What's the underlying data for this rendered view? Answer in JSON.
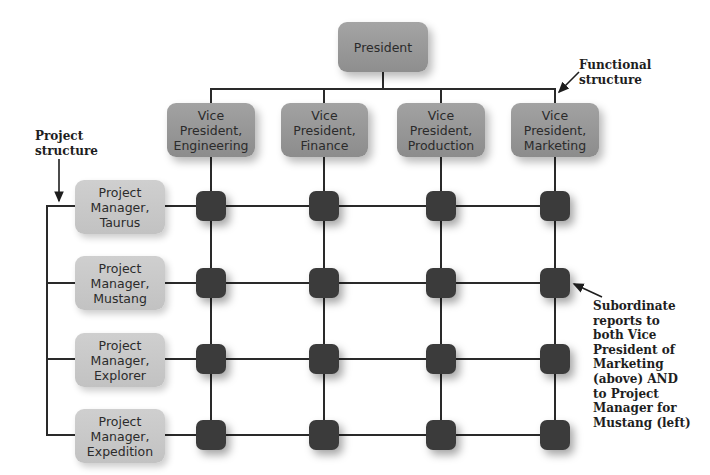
{
  "diagram": {
    "top": {
      "label": "President"
    },
    "functional_heads": [
      {
        "label": "Vice\nPresident,\nEngineering"
      },
      {
        "label": "Vice\nPresident,\nFinance"
      },
      {
        "label": "Vice\nPresident,\nProduction"
      },
      {
        "label": "Vice\nPresident,\nMarketing"
      }
    ],
    "project_managers": [
      {
        "label": "Project\nManager,\nTaurus"
      },
      {
        "label": "Project\nManager,\nMustang"
      },
      {
        "label": "Project\nManager,\nExplorer"
      },
      {
        "label": "Project\nManager,\nExpedition"
      }
    ],
    "annotations": {
      "functional": "Functional\nstructure",
      "project": "Project\nstructure",
      "subordinate": "Subordinate\nreports to\nboth Vice\nPresident of\nMarketing\n(above) AND\nto Project\nManager for\nMustang (left)"
    },
    "grid": {
      "rows": 4,
      "columns": 4,
      "node_count": 16
    },
    "colors": {
      "president_box": "#999999",
      "vp_box": "#979797",
      "pm_box": "#c8c8c8",
      "node": "#3b3b3b",
      "line": "#2a2a2a"
    }
  }
}
